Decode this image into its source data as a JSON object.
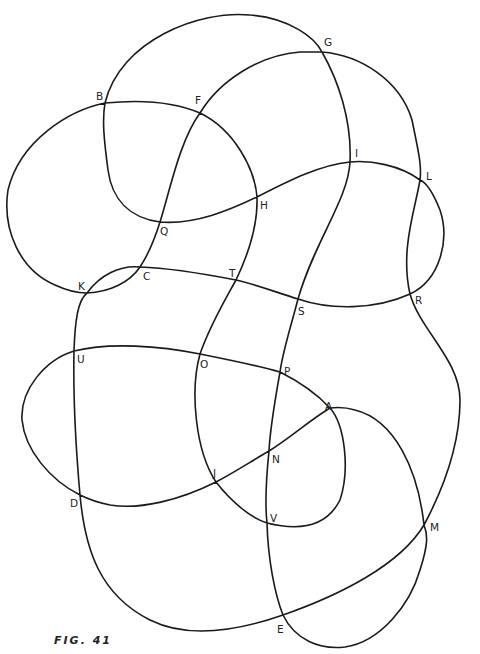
{
  "figure": {
    "caption": "FIG. 41",
    "stroke_color": "#1a1a1a",
    "background": "#ffffff"
  },
  "crossings": [
    {
      "label": "B",
      "x": 105,
      "y": 103,
      "lx": 96,
      "ly": 100
    },
    {
      "label": "F",
      "x": 200,
      "y": 113,
      "lx": 195,
      "ly": 104
    },
    {
      "label": "G",
      "x": 322,
      "y": 52,
      "lx": 324,
      "ly": 46
    },
    {
      "label": "I",
      "x": 350,
      "y": 162,
      "lx": 355,
      "ly": 157
    },
    {
      "label": "L",
      "x": 420,
      "y": 180,
      "lx": 426,
      "ly": 180
    },
    {
      "label": "H",
      "x": 257,
      "y": 197,
      "lx": 260,
      "ly": 209
    },
    {
      "label": "Q",
      "x": 160,
      "y": 222,
      "lx": 160,
      "ly": 235
    },
    {
      "label": "K",
      "x": 87,
      "y": 293,
      "lx": 78,
      "ly": 290
    },
    {
      "label": "C",
      "x": 140,
      "y": 267,
      "lx": 143,
      "ly": 280
    },
    {
      "label": "T",
      "x": 236,
      "y": 280,
      "lx": 229,
      "ly": 277
    },
    {
      "label": "S",
      "x": 298,
      "y": 299,
      "lx": 298,
      "ly": 315
    },
    {
      "label": "R",
      "x": 410,
      "y": 294,
      "lx": 415,
      "ly": 304
    },
    {
      "label": "U",
      "x": 74,
      "y": 351,
      "lx": 77,
      "ly": 363
    },
    {
      "label": "O",
      "x": 200,
      "y": 354,
      "lx": 200,
      "ly": 368
    },
    {
      "label": "P",
      "x": 280,
      "y": 372,
      "lx": 284,
      "ly": 375
    },
    {
      "label": "A",
      "x": 330,
      "y": 408,
      "lx": 325,
      "ly": 410
    },
    {
      "label": "N",
      "x": 269,
      "y": 451,
      "lx": 272,
      "ly": 463
    },
    {
      "label": "J",
      "x": 216,
      "y": 482,
      "lx": 213,
      "ly": 477
    },
    {
      "label": "D",
      "x": 80,
      "y": 495,
      "lx": 70,
      "ly": 507
    },
    {
      "label": "V",
      "x": 267,
      "y": 523,
      "lx": 270,
      "ly": 522
    },
    {
      "label": "M",
      "x": 424,
      "y": 525,
      "lx": 430,
      "ly": 531
    },
    {
      "label": "E",
      "x": 283,
      "y": 615,
      "lx": 277,
      "ly": 633
    }
  ]
}
